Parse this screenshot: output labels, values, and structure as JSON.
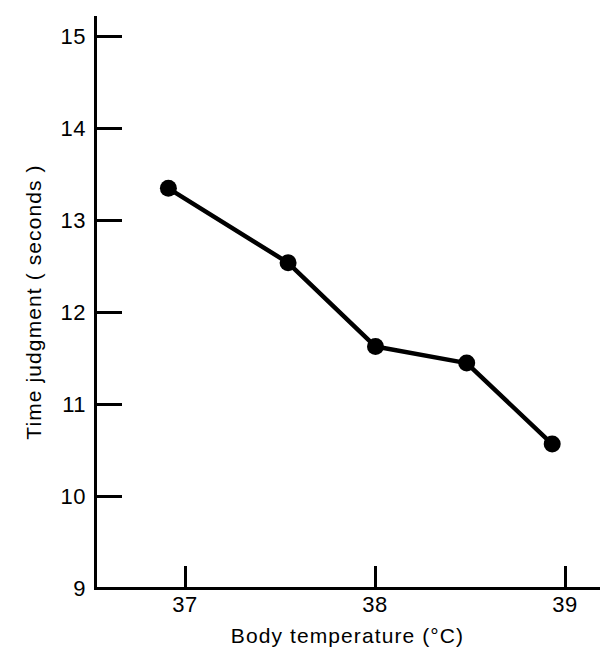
{
  "chart_data": {
    "type": "line",
    "title": "",
    "xlabel": "Body temperature (°C)",
    "ylabel": "Time judgment ( seconds )",
    "xlim": [
      36.47,
      39.18
    ],
    "ylim": [
      9,
      15.2
    ],
    "xticks": [
      37,
      38,
      39
    ],
    "xticklabels": [
      "37",
      "38",
      "39"
    ],
    "yticks": [
      9,
      10,
      11,
      12,
      13,
      14,
      15
    ],
    "yticklabels": [
      "9",
      "10",
      "11",
      "12",
      "13",
      "14",
      "15"
    ],
    "grid": false,
    "legend": false,
    "legend_position": "none",
    "line_color": "#000000",
    "marker_color": "#000000",
    "marker": "filled-circle",
    "series": [
      {
        "name": "Time judgment",
        "x": [
          36.91,
          37.54,
          38.0,
          38.48,
          38.93
        ],
        "values": [
          13.35,
          12.54,
          11.63,
          11.45,
          10.57
        ]
      }
    ],
    "points": [
      {
        "x": 36.91,
        "y": 13.35
      },
      {
        "x": 37.54,
        "y": 12.54
      },
      {
        "x": 38.0,
        "y": 11.63
      },
      {
        "x": 38.48,
        "y": 11.45
      },
      {
        "x": 38.93,
        "y": 10.57
      }
    ],
    "annotations": []
  },
  "axis": {
    "y_title": "Time judgment ( seconds )",
    "x_title": "Body temperature (°C)",
    "y_tick_labels": [
      "15",
      "14",
      "13",
      "12",
      "11",
      "10",
      "9"
    ],
    "x_tick_labels": [
      "37",
      "38",
      "39"
    ]
  }
}
